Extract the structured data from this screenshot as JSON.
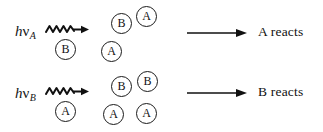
{
  "figure": {
    "background_color": "#ffffff",
    "ink_color": "#111111",
    "width": 323,
    "height": 132
  },
  "rows": [
    {
      "id": "row-a",
      "photon": {
        "h": "h",
        "nu": "ν",
        "subscript": "A",
        "full_text": "hνA"
      },
      "wavy_arrow": {
        "icon": "squiggle-arrow-icon",
        "direction": "right"
      },
      "absorber": {
        "label": "B",
        "icon": "circled-molecule-icon"
      },
      "mixture": [
        {
          "label": "B",
          "icon": "circled-molecule-icon"
        },
        {
          "label": "A",
          "icon": "circled-molecule-icon"
        },
        {
          "label": "A",
          "icon": "circled-molecule-icon"
        }
      ],
      "reaction_arrow": {
        "icon": "right-arrow-icon",
        "direction": "right"
      },
      "outcome": "A reacts"
    },
    {
      "id": "row-b",
      "photon": {
        "h": "h",
        "nu": "ν",
        "subscript": "B",
        "full_text": "hνB"
      },
      "wavy_arrow": {
        "icon": "squiggle-arrow-icon",
        "direction": "right"
      },
      "absorber": {
        "label": "A",
        "icon": "circled-molecule-icon"
      },
      "mixture": [
        {
          "label": "B",
          "icon": "circled-molecule-icon"
        },
        {
          "label": "B",
          "icon": "circled-molecule-icon"
        },
        {
          "label": "A",
          "icon": "circled-molecule-icon"
        },
        {
          "label": "A",
          "icon": "circled-molecule-icon"
        }
      ],
      "reaction_arrow": {
        "icon": "right-arrow-icon",
        "direction": "right"
      },
      "outcome": "B reacts"
    }
  ]
}
